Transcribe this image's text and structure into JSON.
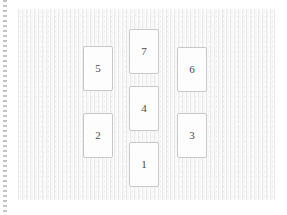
{
  "canvas": {
    "width": 287,
    "height": 215,
    "background_color": "#ffffff"
  },
  "edge_marker": {
    "name": "dotted-edge-line",
    "orientation": "vertical",
    "position": "left",
    "color": "#b9b9b9",
    "style": "dotted"
  },
  "paper": {
    "name": "paper-panel",
    "x": 17,
    "y": 9,
    "width": 258,
    "height": 191,
    "background_color": "#f4f4f4",
    "texture": "woven-paper-grain"
  },
  "layout": {
    "description": "Seven numbered rectangular cards arranged in three vertical columns",
    "columns": [
      "left",
      "center",
      "right"
    ],
    "card_count": 7,
    "card_width": 29,
    "card_height": 45,
    "card_border_color": "#c8c8c8",
    "card_fill_color": "#fdfdfd",
    "label_color": "#4a4a4a"
  },
  "cards": [
    {
      "id": "card-5",
      "label": "5",
      "column": "left",
      "x": 83,
      "y": 46,
      "w": 30,
      "h": 45
    },
    {
      "id": "card-2",
      "label": "2",
      "column": "left",
      "x": 83,
      "y": 113,
      "w": 30,
      "h": 45
    },
    {
      "id": "card-7",
      "label": "7",
      "column": "center",
      "x": 129,
      "y": 29,
      "w": 30,
      "h": 45
    },
    {
      "id": "card-4",
      "label": "4",
      "column": "center",
      "x": 129,
      "y": 86,
      "w": 30,
      "h": 45
    },
    {
      "id": "card-1",
      "label": "1",
      "column": "center",
      "x": 129,
      "y": 142,
      "w": 30,
      "h": 45
    },
    {
      "id": "card-6",
      "label": "6",
      "column": "right",
      "x": 177,
      "y": 47,
      "w": 30,
      "h": 45
    },
    {
      "id": "card-3",
      "label": "3",
      "column": "right",
      "x": 177,
      "y": 113,
      "w": 30,
      "h": 45
    }
  ]
}
